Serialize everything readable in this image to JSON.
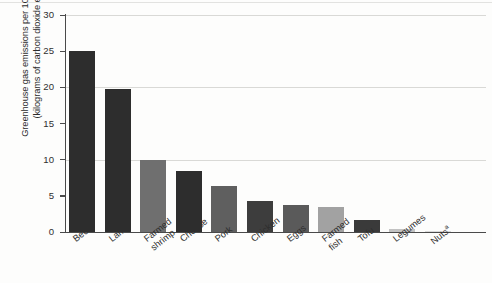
{
  "chart_data": {
    "type": "bar",
    "title": "",
    "xlabel": "",
    "ylabel_line1": "Greenhouse gas emissions per 100 grams protein",
    "ylabel_line2": "(kilograms of carbon dioxide equivalents)",
    "ylim": [
      0,
      30
    ],
    "yticks": [
      "0",
      "5",
      "10",
      "15",
      "20",
      "25",
      "30"
    ],
    "ytick_values": [
      0,
      5,
      10,
      15,
      20,
      25,
      30
    ],
    "grid": "horizontal gridlines at 10, 20 and 30",
    "legend": "none",
    "categories": [
      "Beef",
      "Lamb",
      "Farmed shrimp",
      "Cheese",
      "Pork",
      "Chicken",
      "Eggs",
      "Farmed fish",
      "Tofu",
      "Legumes",
      "Nuts"
    ],
    "category_lines": [
      [
        "Beef"
      ],
      [
        "Lamb"
      ],
      [
        "Farmed",
        "shrimp"
      ],
      [
        "Cheese"
      ],
      [
        "Pork"
      ],
      [
        "Chicken"
      ],
      [
        "Eggs"
      ],
      [
        "Farmed",
        "fish"
      ],
      [
        "Tofu"
      ],
      [
        "Legumes"
      ],
      [
        "Nuts"
      ]
    ],
    "category_footnotes": [
      "",
      "",
      "",
      "",
      "",
      "",
      "",
      "",
      "",
      "",
      "a"
    ],
    "values": [
      25.0,
      19.8,
      10.0,
      8.4,
      6.4,
      4.3,
      3.8,
      3.5,
      1.6,
      0.4,
      0.1
    ],
    "bar_colors": [
      "#2d2d2d",
      "#2d2d2d",
      "#6f6f6f",
      "#2d2d2d",
      "#5f5f5f",
      "#3d3d3d",
      "#5a5a5a",
      "#a2a2a2",
      "#3a3a3a",
      "#c2c2c2",
      "#dadada"
    ],
    "axis_color": "#4a4a4a",
    "grid_color": "#d9d9d6",
    "background": "#fdfdfc"
  }
}
